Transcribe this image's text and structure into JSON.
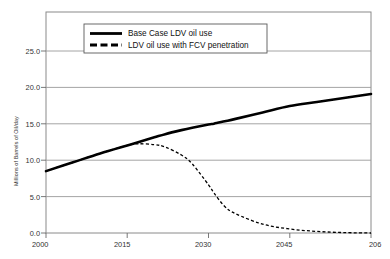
{
  "chart_data": {
    "type": "line",
    "title": "",
    "xlabel": "",
    "ylabel": "Millions of Barrels of Oil/day",
    "xlim": [
      2000,
      2060
    ],
    "ylim": [
      0.0,
      27.5
    ],
    "grid": true,
    "legend_position": "top-left",
    "x_ticks": [
      "2000",
      "2015",
      "2030",
      "2045",
      "206"
    ],
    "x_tick_values": [
      2000,
      2015,
      2030,
      2045,
      2060
    ],
    "y_ticks": [
      "0.0",
      "5.0",
      "10.0",
      "15.0",
      "20.0",
      "25.0"
    ],
    "y_tick_values": [
      0.0,
      5.0,
      10.0,
      15.0,
      20.0,
      25.0
    ],
    "x": [
      2000,
      2005,
      2010,
      2015,
      2017,
      2020,
      2022,
      2025,
      2027,
      2030,
      2031,
      2033,
      2035,
      2040,
      2045,
      2050,
      2055,
      2060
    ],
    "series": [
      {
        "name": "Base Case LDV oil use",
        "style": "solid",
        "color": "#000000",
        "values": [
          7.7,
          8.8,
          9.9,
          10.9,
          11.3,
          11.9,
          12.3,
          12.8,
          13.1,
          13.5,
          13.6,
          13.9,
          14.2,
          15.0,
          15.8,
          16.3,
          16.8,
          17.3
        ]
      },
      {
        "name": "LDV oil use with FCV penetration",
        "style": "dashed",
        "color": "#000000",
        "values": [
          7.7,
          8.8,
          9.9,
          10.9,
          11.1,
          11.0,
          10.7,
          9.7,
          8.6,
          6.0,
          5.0,
          3.3,
          2.4,
          1.1,
          0.5,
          0.2,
          0.05,
          0.0
        ]
      }
    ]
  },
  "legend": {
    "entries": [
      {
        "label": "Base Case LDV oil use",
        "style": "solid"
      },
      {
        "label": "LDV oil use with FCV penetration",
        "style": "dashed"
      }
    ]
  }
}
